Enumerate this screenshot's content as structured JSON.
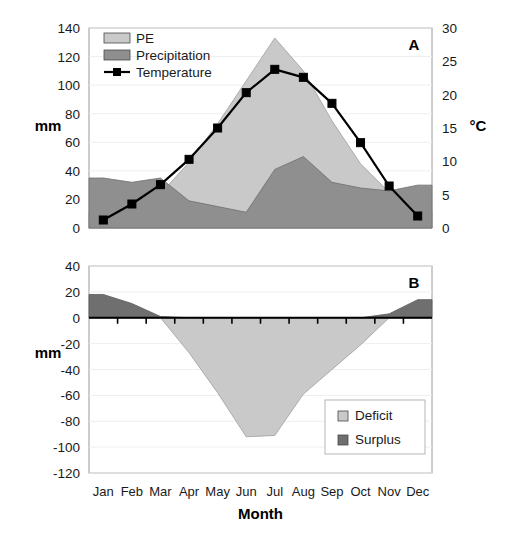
{
  "figure": {
    "width": 506,
    "height": 540,
    "background": "#ffffff"
  },
  "colors": {
    "pe_fill": "#c9c9c9",
    "precipitation_fill": "#8f8f8f",
    "deficit_fill": "#c9c9c9",
    "surplus_fill": "#6f6f6f",
    "line": "#000000",
    "grid": "#eceff1",
    "frame": "#9a9a9a",
    "text": "#1a1a1a"
  },
  "axis_titles": {
    "panel_a_left": "mm",
    "panel_a_right": "°C",
    "panel_b_left": "mm",
    "x_axis": "Month"
  },
  "panel_labels": {
    "a": "A",
    "b": "B"
  },
  "months": [
    "Jan",
    "Feb",
    "Mar",
    "Apr",
    "May",
    "Jun",
    "Jul",
    "Aug",
    "Sep",
    "Oct",
    "Nov",
    "Dec"
  ],
  "chart_data": [
    {
      "id": "panel-a",
      "type": "area",
      "title": "A",
      "xlabel": "Month",
      "ylabel": "mm",
      "y2label": "°C",
      "categories": [
        "Jan",
        "Feb",
        "Mar",
        "Apr",
        "May",
        "Jun",
        "Jul",
        "Aug",
        "Sep",
        "Oct",
        "Nov",
        "Dec"
      ],
      "ylim": [
        0,
        140
      ],
      "yticks": [
        0,
        20,
        40,
        60,
        80,
        100,
        120,
        140
      ],
      "y2lim": [
        0,
        30
      ],
      "y2ticks": [
        0,
        5,
        10,
        15,
        20,
        25,
        30
      ],
      "grid": true,
      "legend_position": "top-left",
      "series": [
        {
          "name": "PE",
          "type": "area",
          "axis": "left",
          "unit": "mm",
          "color": "#c9c9c9",
          "values": [
            11,
            14,
            24,
            46,
            73,
            103,
            133,
            110,
            75,
            45,
            25,
            12
          ]
        },
        {
          "name": "Precipitation",
          "type": "area",
          "axis": "left",
          "unit": "mm",
          "color": "#8f8f8f",
          "values": [
            35,
            32,
            35,
            19,
            15,
            11,
            41,
            50,
            32,
            28,
            26,
            30
          ]
        },
        {
          "name": "Temperature",
          "type": "line",
          "axis": "right",
          "unit": "°C",
          "color": "#000000",
          "marker": "square",
          "values": [
            1.2,
            3.6,
            6.5,
            10.3,
            15.0,
            20.3,
            23.8,
            22.6,
            18.7,
            12.8,
            6.3,
            1.8
          ]
        }
      ]
    },
    {
      "id": "panel-b",
      "type": "area",
      "title": "B",
      "xlabel": "Month",
      "ylabel": "mm",
      "categories": [
        "Jan",
        "Feb",
        "Mar",
        "Apr",
        "May",
        "Jun",
        "Jul",
        "Aug",
        "Sep",
        "Oct",
        "Nov",
        "Dec"
      ],
      "ylim": [
        -120,
        40
      ],
      "yticks": [
        40,
        20,
        0,
        -20,
        -40,
        -60,
        -80,
        -100,
        -120
      ],
      "grid": true,
      "legend_position": "bottom-right",
      "series": [
        {
          "name": "Deficit",
          "type": "area",
          "unit": "mm",
          "color": "#c9c9c9",
          "values": [
            0,
            0,
            0,
            -27,
            -58,
            -92,
            -91,
            -59,
            -40,
            -21,
            0,
            0
          ]
        },
        {
          "name": "Surplus",
          "type": "area",
          "unit": "mm",
          "color": "#6f6f6f",
          "values": [
            18,
            11,
            1,
            0,
            0,
            0,
            0,
            0,
            0,
            0,
            3,
            14
          ]
        }
      ]
    }
  ],
  "legend_a": {
    "items": [
      {
        "label": "PE",
        "swatch": "#c9c9c9",
        "kind": "area"
      },
      {
        "label": "Precipitation",
        "swatch": "#8f8f8f",
        "kind": "area"
      },
      {
        "label": "Temperature",
        "swatch": "#000000",
        "kind": "line-marker"
      }
    ]
  },
  "legend_b": {
    "items": [
      {
        "label": "Deficit",
        "swatch": "#c9c9c9",
        "kind": "area"
      },
      {
        "label": "Surplus",
        "swatch": "#6f6f6f",
        "kind": "area"
      }
    ]
  }
}
